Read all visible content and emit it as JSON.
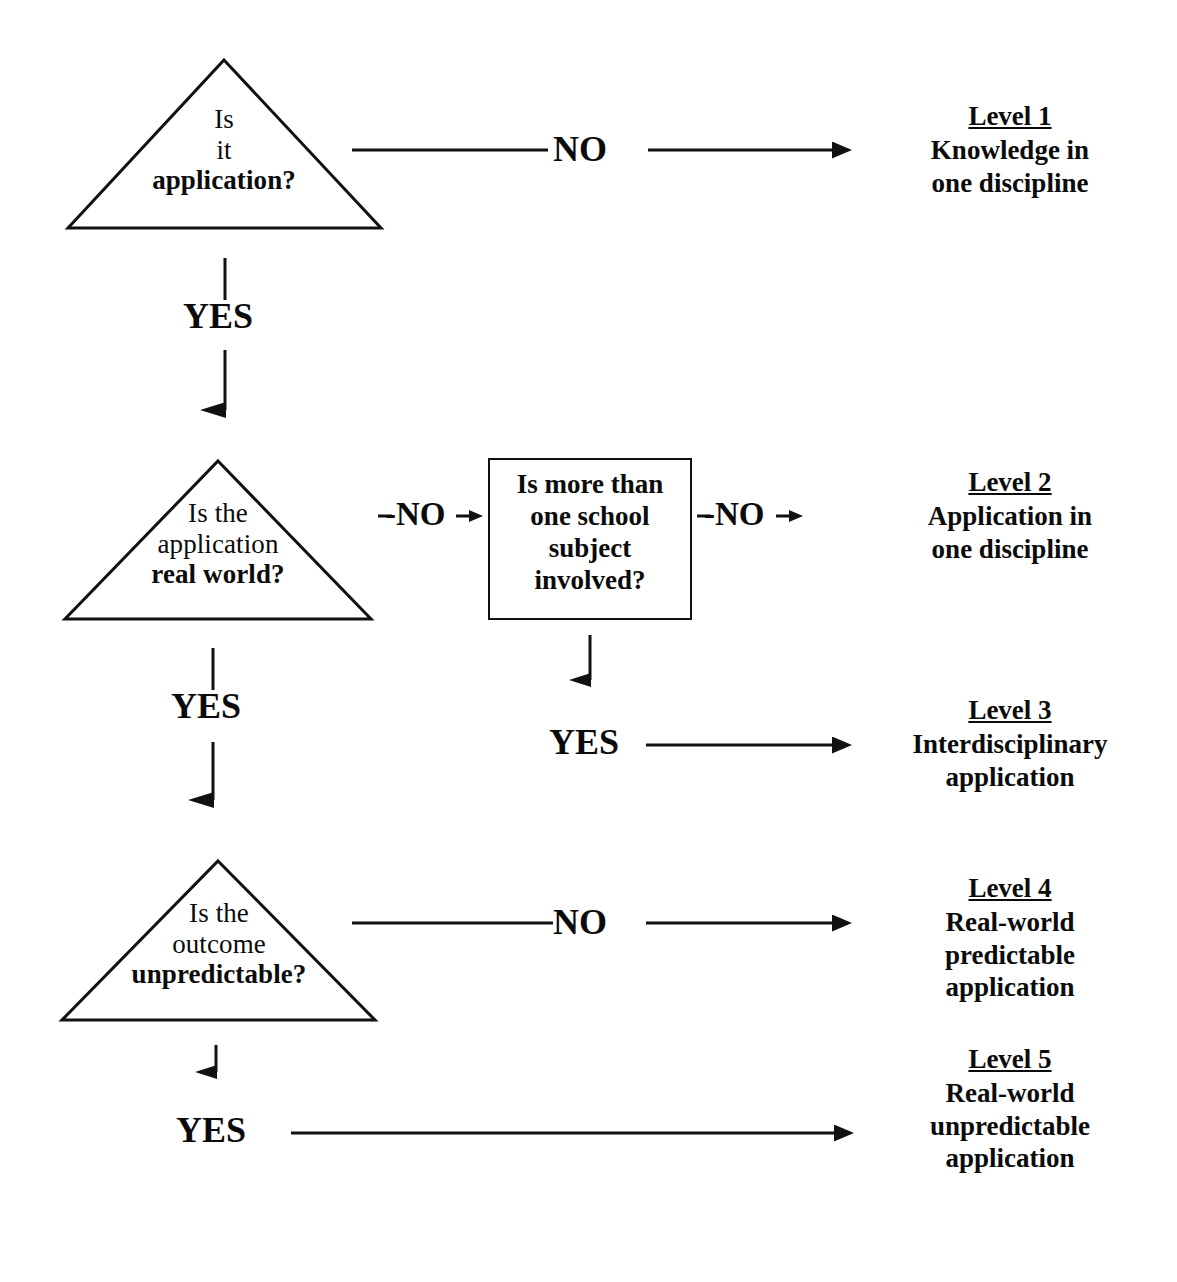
{
  "diagram": {
    "ink_color": "#111111",
    "background": "#ffffff",
    "top_cropped_fragment": "",
    "nodes": [
      {
        "id": "q1",
        "shape": "triangle",
        "lines": [
          "Is",
          "it",
          "application?"
        ],
        "bold_lines": [
          2
        ]
      },
      {
        "id": "q2",
        "shape": "triangle",
        "lines": [
          "Is the",
          "application",
          "real world?"
        ],
        "bold_lines": [
          2
        ]
      },
      {
        "id": "q3",
        "shape": "rectangle",
        "lines": [
          "Is more than",
          "one school",
          "subject",
          "involved?"
        ],
        "bold_lines": []
      },
      {
        "id": "q4",
        "shape": "triangle",
        "lines": [
          "Is the",
          "outcome",
          "unpredictable?"
        ],
        "bold_lines": [
          2
        ]
      }
    ],
    "edge_labels": {
      "no_1": "NO",
      "yes_1": "YES",
      "no_2": "-NO",
      "no_3": "-NO",
      "yes_2": "YES",
      "yes_3": "YES",
      "no_4": "NO",
      "yes_4": "YES"
    },
    "outcomes": [
      {
        "id": "level1",
        "title": "Level 1",
        "lines": [
          "Knowledge in",
          "one discipline"
        ]
      },
      {
        "id": "level2",
        "title": "Level 2",
        "lines": [
          "Application in",
          "one discipline"
        ]
      },
      {
        "id": "level3",
        "title": "Level 3",
        "lines": [
          "Interdisciplinary",
          "application"
        ]
      },
      {
        "id": "level4",
        "title": "Level 4",
        "lines": [
          "Real-world",
          "predictable",
          "application"
        ]
      },
      {
        "id": "level5",
        "title": "Level 5",
        "lines": [
          "Real-world",
          "unpredictable",
          "application"
        ]
      }
    ]
  }
}
